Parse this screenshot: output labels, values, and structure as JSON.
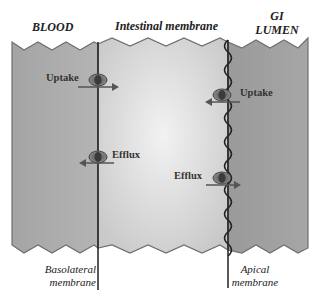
{
  "diagram": {
    "regions": {
      "blood": "BLOOD",
      "intestinal_membrane": "Intestinal membrane",
      "gi_lumen_line1": "GI",
      "gi_lumen_line2": "LUMEN"
    },
    "membranes": {
      "basolateral_line1": "Basolateral",
      "basolateral_line2": "membrane",
      "apical_line1": "Apical",
      "apical_line2": "membrane"
    },
    "transporters": [
      {
        "label": "Uptake",
        "membrane": "basolateral",
        "direction": "into-cell"
      },
      {
        "label": "Efflux",
        "membrane": "basolateral",
        "direction": "to-blood"
      },
      {
        "label": "Uptake",
        "membrane": "apical",
        "direction": "into-cell"
      },
      {
        "label": "Efflux",
        "membrane": "apical",
        "direction": "to-lumen"
      }
    ],
    "colors": {
      "blood": "#a9a9a9",
      "cell": "#d6d6d6",
      "lumen": "#9c9c9c",
      "edge": "#6f6f6f",
      "line": "#222222"
    }
  }
}
